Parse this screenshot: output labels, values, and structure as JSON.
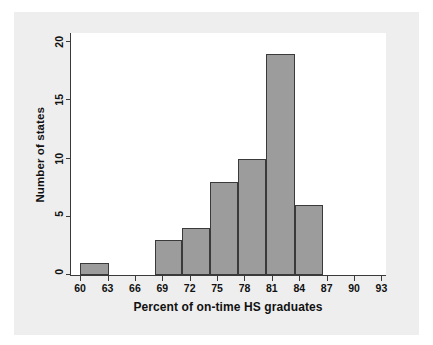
{
  "figure": {
    "page_background": "#ffffff",
    "panel_background": "#eeeeee",
    "plot_background": "#ffffff",
    "axis_color": "#3a3a3a",
    "bar_fill": "#9c9c9c",
    "bar_edge": "#3a3a3a"
  },
  "chart_data": {
    "type": "bar",
    "title": "",
    "subtitle": "",
    "xlabel": "Percent of on-time HS graduates",
    "ylabel": "Number of states",
    "grid": false,
    "legend": null,
    "xlim": [
      59,
      93.5
    ],
    "ylim": [
      0,
      20.8
    ],
    "xticks": [
      60,
      63,
      66,
      69,
      72,
      75,
      78,
      81,
      84,
      87,
      90,
      93
    ],
    "xtick_labels": [
      "60",
      "63",
      "66",
      "69",
      "72",
      "75",
      "78",
      "81",
      "84",
      "87",
      "90",
      "93"
    ],
    "yticks": [
      0,
      5,
      10,
      15,
      20
    ],
    "ytick_labels": [
      "0",
      "5",
      "10",
      "15",
      "20"
    ],
    "bin_width": 3,
    "bins": [
      {
        "label": "60-63",
        "x0": 60.0,
        "x1": 63.2,
        "value": 1
      },
      {
        "label": "68-71",
        "x0": 68.2,
        "x1": 71.2,
        "value": 3
      },
      {
        "label": "71-74",
        "x0": 71.2,
        "x1": 74.2,
        "value": 4
      },
      {
        "label": "74-77",
        "x0": 74.2,
        "x1": 77.3,
        "value": 8
      },
      {
        "label": "77-80",
        "x0": 77.3,
        "x1": 80.4,
        "value": 10
      },
      {
        "label": "80-83",
        "x0": 80.4,
        "x1": 83.5,
        "value": 19
      },
      {
        "label": "83-86",
        "x0": 83.5,
        "x1": 86.6,
        "value": 6
      }
    ],
    "categories": [
      "60-63",
      "68-71",
      "71-74",
      "74-77",
      "77-80",
      "80-83",
      "83-86"
    ],
    "values": [
      1,
      3,
      4,
      8,
      10,
      19,
      6
    ]
  }
}
